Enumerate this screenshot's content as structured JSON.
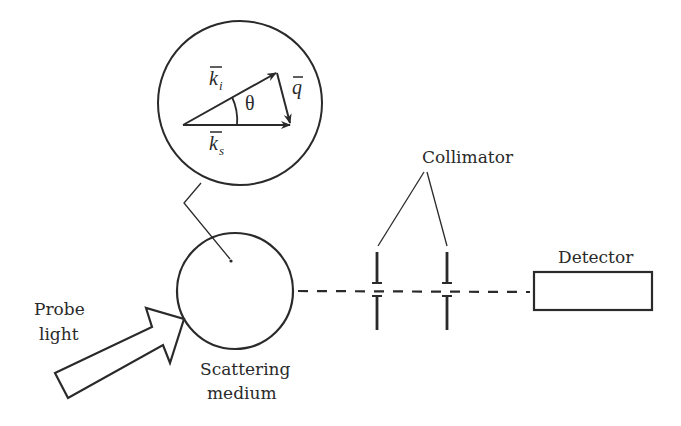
{
  "diagram": {
    "colors": {
      "ink": "#2a2a2a",
      "background": "#ffffff"
    },
    "inset": {
      "vectors": {
        "incident": {
          "symbol": "k",
          "subscript": "i"
        },
        "scattered": {
          "symbol": "k",
          "subscript": "s"
        },
        "transfer": {
          "symbol": "q"
        }
      },
      "angle_label": "θ"
    },
    "labels": {
      "probe_light_line1": "Probe",
      "probe_light_line2": "light",
      "scattering_medium_line1": "Scattering",
      "scattering_medium_line2": "medium",
      "collimator": "Collimator",
      "detector": "Detector"
    }
  }
}
